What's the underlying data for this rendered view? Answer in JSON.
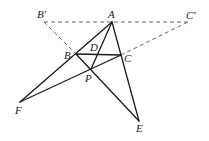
{
  "diagram": {
    "type": "geometry-figure",
    "points": {
      "A": {
        "label": "A",
        "x": 112,
        "y": 22
      },
      "B1": {
        "label": "B′",
        "x": 44,
        "y": 22
      },
      "C1": {
        "label": "C′",
        "x": 188,
        "y": 22
      },
      "B": {
        "label": "B",
        "x": 76,
        "y": 54
      },
      "C": {
        "label": "C",
        "x": 121,
        "y": 55
      },
      "D": {
        "label": "D",
        "x": 98,
        "y": 54
      },
      "P": {
        "label": "P",
        "x": 91,
        "y": 69
      },
      "F": {
        "label": "F",
        "x": 20,
        "y": 102
      },
      "E": {
        "label": "E",
        "x": 139,
        "y": 121
      }
    },
    "solid_segments": [
      "A-F",
      "A-E",
      "A-P",
      "B-C",
      "B-E",
      "C-F"
    ],
    "dashed_segments": [
      "B′-C′",
      "B′-B",
      "C-C′"
    ]
  }
}
